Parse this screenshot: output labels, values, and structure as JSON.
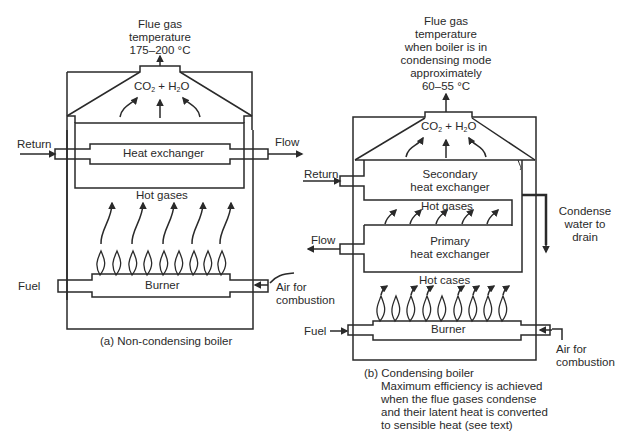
{
  "diagram_a": {
    "caption": "(a) Non-condensing boiler",
    "flue_label_lines": [
      "Flue gas",
      "temperature",
      "175–200 °C"
    ],
    "products": {
      "co": "CO",
      "co_sub": "2",
      "plus": " + H",
      "h_sub": "2",
      "o": "O"
    },
    "heat_exchanger": "Heat exchanger",
    "hot_gases": "Hot gases",
    "burner": "Burner",
    "return": "Return",
    "flow": "Flow",
    "fuel": "Fuel",
    "air_lines": [
      "Air for",
      "combustion"
    ]
  },
  "diagram_b": {
    "caption": "(b) Condensing boiler",
    "caption_detail_lines": [
      "Maximum efficiency is achieved",
      "when the flue gases condense",
      "and their latent heat is converted",
      "to sensible heat (see text)"
    ],
    "flue_label_lines": [
      "Flue gas",
      "temperature",
      "when boiler is in",
      "condensing mode",
      "approximately",
      "60–55 °C"
    ],
    "products": {
      "co": "CO",
      "co_sub": "2",
      "plus": " + H",
      "h_sub": "2",
      "o": "O"
    },
    "secondary_hx_lines": [
      "Secondary",
      "heat exchanger"
    ],
    "hot_gases": "Hot gases",
    "primary_hx_lines": [
      "Primary",
      "heat exchanger"
    ],
    "hot_cases": "Hot cases",
    "burner": "Burner",
    "return": "Return",
    "flow": "Flow",
    "fuel": "Fuel",
    "air_lines": [
      "Air for",
      "combustion"
    ],
    "condense_lines": [
      "Condense",
      "water to",
      "drain"
    ]
  }
}
